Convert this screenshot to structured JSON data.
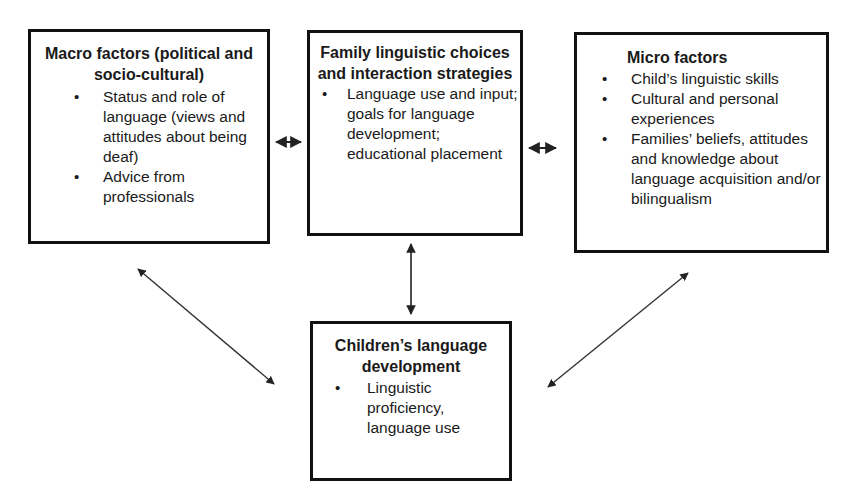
{
  "diagram": {
    "boxes": {
      "macro": {
        "title": "Macro factors (political and socio-cultural)",
        "items": [
          "Status and role of language (views and attitudes about being deaf)",
          "Advice from professionals"
        ]
      },
      "family": {
        "title": "Family linguistic choices and interaction strategies",
        "items": [
          "Language use and input; goals for language development; educational placement"
        ]
      },
      "micro": {
        "title": "Micro factors",
        "items": [
          "Child’s linguistic skills",
          "Cultural and personal experiences",
          "Families’ beliefs, attitudes and knowledge about language acquisition and/or bilingualism"
        ]
      },
      "children": {
        "title": "Children’s language development",
        "items": [
          "Linguistic proficiency, language use"
        ]
      }
    },
    "connections": [
      {
        "from": "macro",
        "to": "family",
        "type": "bidirectional"
      },
      {
        "from": "family",
        "to": "micro",
        "type": "bidirectional"
      },
      {
        "from": "family",
        "to": "children",
        "type": "bidirectional"
      },
      {
        "from": "macro",
        "to": "children",
        "type": "bidirectional"
      },
      {
        "from": "micro",
        "to": "children",
        "type": "bidirectional"
      }
    ],
    "colors": {
      "stroke": "#111111",
      "background": "#ffffff"
    }
  }
}
